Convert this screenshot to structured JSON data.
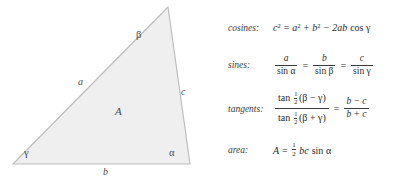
{
  "figure": {
    "name": "triangle-diagram",
    "fill_color": "#efefef",
    "stroke_color": "#b9b9b9",
    "vertices": {
      "apex": [
        168,
        7
      ],
      "bottom_left": [
        13,
        164
      ],
      "bottom_right": [
        190,
        164
      ]
    },
    "labels": {
      "angle_beta": "β",
      "angle_gamma": "γ",
      "angle_alpha": "α",
      "side_a": "a",
      "side_b": "b",
      "side_c": "c",
      "area": "A"
    }
  },
  "formulas": {
    "cosines": {
      "label": "cosines:",
      "lhs_base": "c",
      "lhs_exp": "2",
      "eq": "=",
      "t1_base": "a",
      "t1_exp": "2",
      "plus": "+",
      "t2_base": "b",
      "t2_exp": "2",
      "minus": "−",
      "coef": "2ab",
      "func": "cos",
      "angle": "γ"
    },
    "sines": {
      "label": "sines:",
      "f1_num": "a",
      "f1_den_fn": "sin",
      "f1_den_angle": "α",
      "eq1": "=",
      "f2_num": "b",
      "f2_den_fn": "sin",
      "f2_den_angle": "β",
      "eq2": "=",
      "f3_num": "c",
      "f3_den_fn": "sin",
      "f3_den_angle": "γ"
    },
    "tangents": {
      "label": "tangents:",
      "num_fn": "tan",
      "num_half_top": "1",
      "num_half_bot": "2",
      "num_expr": "(β − γ)",
      "den_fn": "tan",
      "den_half_top": "1",
      "den_half_bot": "2",
      "den_expr": "(β + γ)",
      "eq": "=",
      "rhs_num": "b − c",
      "rhs_den": "b + c"
    },
    "area": {
      "label": "area:",
      "lhs": "A",
      "eq": "=",
      "half_top": "1",
      "half_bot": "2",
      "factors": "bc",
      "func": "sin",
      "angle": "α"
    }
  }
}
